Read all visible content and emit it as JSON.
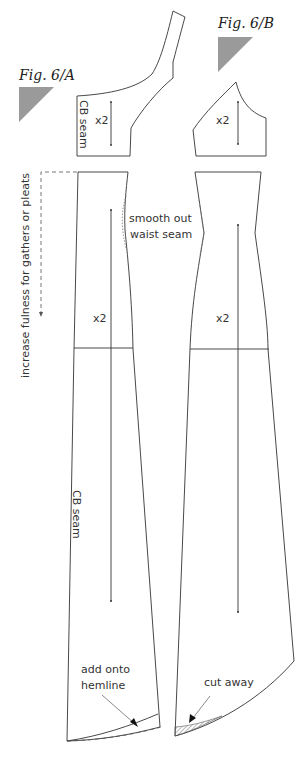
{
  "figures": {
    "a": {
      "title": "Fig. 6/A"
    },
    "b": {
      "title": "Fig. 6/B"
    }
  },
  "labels": {
    "cb_seam_top": "CB seam",
    "cb_seam_skirt": "CB seam",
    "x2_a_top": "x2",
    "x2_b_top": "x2",
    "x2_a_skirt": "x2",
    "x2_b_skirt": "x2",
    "increase_fulness": "increase fulness for gathers or pleats",
    "smooth_out_line1": "smooth out",
    "smooth_out_line2": "waist seam",
    "add_onto_line1": "add onto",
    "add_onto_line2": "hemline",
    "cut_away": "cut away"
  },
  "colors": {
    "line": "#333333",
    "triangle": "#9a9a9a"
  }
}
